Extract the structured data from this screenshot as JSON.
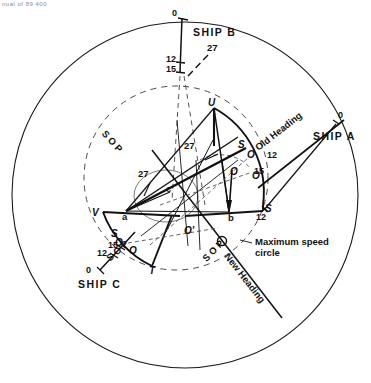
{
  "figure": {
    "type": "maritime-relative-motion-plot",
    "corner_note": "nual of 89 400",
    "background": "#ffffff",
    "ink": "#000000",
    "dash_color": "#555555"
  },
  "outer_circle": {
    "label": "outer-plotting-circle",
    "cx": 185,
    "cy": 195,
    "r": 173
  },
  "maximum_speed_circle": {
    "caption_line1": "Maximum speed",
    "caption_line2": "circle",
    "cx": 176,
    "cy": 178,
    "r": 92
  },
  "ships": [
    {
      "id": "A",
      "label": "SHIP A",
      "ticks": [
        "0",
        "12"
      ],
      "heading_label": "Old Heading"
    },
    {
      "id": "B",
      "label": "SHIP B",
      "ticks": [
        "0",
        "12",
        "15"
      ],
      "vector_label": "27"
    },
    {
      "id": "C",
      "label": "SHIP C",
      "ticks": [
        "0",
        "12",
        "15"
      ],
      "sop_label": "S O P"
    }
  ],
  "headings": {
    "old": "Old Heading",
    "new": "New Heading"
  },
  "sop_labels": [
    {
      "name": "sop-left-arc",
      "text": "S O P"
    },
    {
      "name": "sop-bottom-right",
      "text": "S O P"
    },
    {
      "name": "sop-ship-c",
      "text": "S O P"
    }
  ],
  "numeric_annotations": [
    {
      "name": "annot-27-left",
      "text": "27"
    },
    {
      "name": "annot-27-center",
      "text": "27"
    },
    {
      "name": "annot-27-shipb",
      "text": "27"
    },
    {
      "name": "annot-12-shipb",
      "text": "12"
    },
    {
      "name": "annot-15-shipb",
      "text": "15"
    },
    {
      "name": "annot-0-shipb",
      "text": "0"
    },
    {
      "name": "annot-0-shipa",
      "text": "0"
    },
    {
      "name": "annot-12-shipa",
      "text": "12"
    },
    {
      "name": "annot-0-shipc",
      "text": "0"
    },
    {
      "name": "annot-12-shipc",
      "text": "12"
    },
    {
      "name": "annot-15-shipc",
      "text": "15"
    },
    {
      "name": "annot-12-right",
      "text": "12"
    },
    {
      "name": "annot-15-right",
      "text": "15"
    }
  ],
  "vertices": [
    {
      "name": "vertex-U",
      "text": "U",
      "x": 208,
      "y": 104
    },
    {
      "name": "vertex-V",
      "text": "V",
      "x": 96,
      "y": 214
    },
    {
      "name": "vertex-T",
      "text": "T",
      "x": 152,
      "y": 270
    },
    {
      "name": "vertex-S-right",
      "text": "S",
      "x": 265,
      "y": 210
    },
    {
      "name": "vertex-S-inner",
      "text": "S",
      "x": 239,
      "y": 146
    },
    {
      "name": "vertex-S-lower",
      "text": "S",
      "x": 114,
      "y": 234
    },
    {
      "name": "point-a",
      "text": "a",
      "x": 124,
      "y": 215
    },
    {
      "name": "point-b",
      "text": "b",
      "x": 229,
      "y": 216
    },
    {
      "name": "point-c",
      "text": "c",
      "x": 167,
      "y": 188
    },
    {
      "name": "point-O-center",
      "text": "O",
      "x": 233,
      "y": 172
    },
    {
      "name": "point-O-prime",
      "text": "O'",
      "x": 185,
      "y": 231
    },
    {
      "name": "point-O-right-upper",
      "text": "O",
      "x": 248,
      "y": 156
    },
    {
      "name": "point-O-right-lower",
      "text": "O",
      "x": 252,
      "y": 175
    },
    {
      "name": "point-O-left-upper",
      "text": "O",
      "x": 118,
      "y": 243
    },
    {
      "name": "point-O-left-lower",
      "text": "O",
      "x": 130,
      "y": 250
    }
  ]
}
